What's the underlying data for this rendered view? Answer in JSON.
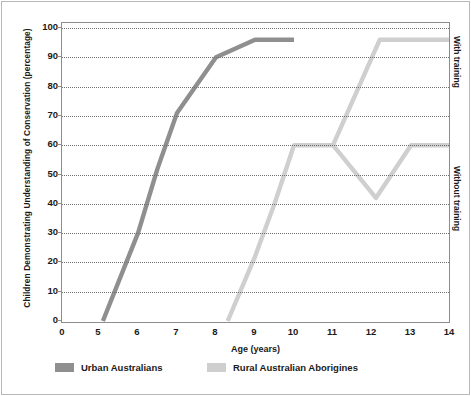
{
  "chart_data": {
    "type": "line",
    "title": "",
    "xlabel": "Age (years)",
    "ylabel": "Children Demonstrating Understanding of Conservation (percentage)",
    "xlim": [
      0,
      14
    ],
    "ylim": [
      0,
      100
    ],
    "xticks": [
      0,
      5,
      6,
      7,
      8,
      9,
      10,
      11,
      12,
      13,
      14
    ],
    "xtick_labels": [
      "0",
      "5",
      "6",
      "7",
      "8",
      "9",
      "10",
      "11",
      "12",
      "13",
      "14"
    ],
    "yticks": [
      0,
      10,
      20,
      30,
      40,
      50,
      60,
      70,
      80,
      90,
      100
    ],
    "ytick_labels": [
      "0",
      "10",
      "20",
      "30",
      "40",
      "50",
      "60",
      "70",
      "80",
      "90",
      "100"
    ],
    "grid": "horizontal-dotted",
    "legend_position": "bottom-left",
    "series": [
      {
        "name": "Urban Australians",
        "color": "#8f8f8f",
        "points": [
          {
            "x": 5.1,
            "y": 0
          },
          {
            "x": 6.0,
            "y": 30
          },
          {
            "x": 6.5,
            "y": 52
          },
          {
            "x": 7.0,
            "y": 71
          },
          {
            "x": 8.0,
            "y": 90
          },
          {
            "x": 9.0,
            "y": 96
          },
          {
            "x": 10.0,
            "y": 96
          }
        ]
      },
      {
        "name": "Rural Australian Aborigines",
        "color": "#cfcfcf",
        "points": [
          {
            "x": 8.3,
            "y": 0
          },
          {
            "x": 9.0,
            "y": 22
          },
          {
            "x": 9.5,
            "y": 40
          },
          {
            "x": 10.0,
            "y": 60
          },
          {
            "x": 11.0,
            "y": 60
          }
        ]
      },
      {
        "name": "Rural Australian Aborigines (with training)",
        "color": "#cfcfcf",
        "points": [
          {
            "x": 11.0,
            "y": 60
          },
          {
            "x": 12.2,
            "y": 96
          },
          {
            "x": 14.0,
            "y": 96
          }
        ]
      },
      {
        "name": "Rural Australian Aborigines (without training)",
        "color": "#cfcfcf",
        "points": [
          {
            "x": 11.0,
            "y": 60
          },
          {
            "x": 12.1,
            "y": 42
          },
          {
            "x": 13.0,
            "y": 60
          },
          {
            "x": 14.0,
            "y": 60
          }
        ]
      }
    ],
    "annotations": [
      {
        "text": "With training",
        "position": "right",
        "value_band": [
          60,
          100
        ]
      },
      {
        "text": "Without training",
        "position": "right",
        "value_band": [
          0,
          60
        ]
      }
    ]
  },
  "legend": {
    "items": [
      {
        "label": "Urban Australians",
        "color": "#8f8f8f"
      },
      {
        "label": "Rural Australian Aborigines",
        "color": "#cfcfcf"
      }
    ]
  },
  "axes": {
    "x_title": "Age (years)",
    "y_title": "Children Demonstrating Understanding of Conservation (percentage)"
  },
  "side_labels": {
    "with_training": "With training",
    "without_training": "Without training"
  },
  "colors": {
    "urban": "#8f8f8f",
    "rural": "#cfcfcf",
    "grid": "#6f6f6f",
    "frame": "#8d8d8d",
    "text": "#1a1a1a"
  }
}
